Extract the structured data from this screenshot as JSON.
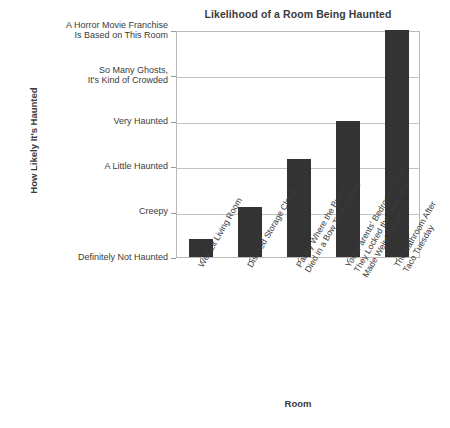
{
  "chart_data": {
    "type": "bar",
    "title": "Likelihood of a Room Being Haunted",
    "xlabel": "Room",
    "ylabel": "How Likely It's Haunted",
    "grid": true,
    "legend": "none",
    "categories": [
      "Well-Lit Living Room",
      "Disused Storage Closet",
      "Pantry Where the Butler\nDied in a Bow Tie Accident",
      "Your Parents' Bedroom When\nThey Locked the Door and\nMade Weird Noises",
      "The Bathroom After\nTaco Tuesday"
    ],
    "y_tick_labels": [
      "Definitely Not Haunted",
      "Creepy",
      "A Little Haunted",
      "Very Haunted",
      "So Many Ghosts,\nIt's Kind of Crowded",
      "A Horror Movie Franchise\nIs Based on This Room"
    ],
    "ylim": [
      0,
      5
    ],
    "values": [
      0.4,
      1.1,
      2.15,
      3.0,
      5.0
    ],
    "bar_color": "#333333",
    "grid_color": "#c3c3c3",
    "axis_color": "#b9b9b9",
    "text_color": "#3b3b3b"
  }
}
